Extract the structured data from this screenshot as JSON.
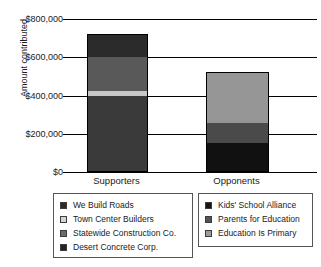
{
  "chart_data": {
    "type": "bar",
    "subtype": "stacked-bar",
    "title": "",
    "xlabel": "",
    "ylabel": "Amount contributed",
    "categories": [
      "Supporters",
      "Opponents"
    ],
    "ylim": [
      0,
      800000
    ],
    "ytick_values": [
      0,
      200000,
      400000,
      600000,
      800000
    ],
    "ytick_labels": [
      "$0",
      "$200,000",
      "$400,000",
      "$600,000",
      "$800,000"
    ],
    "grid": true,
    "legend_position": "bottom",
    "series": [
      {
        "name": "We Build Roads",
        "group": "Supporters",
        "color": "#2b2b2b",
        "values": [
          115000,
          0
        ]
      },
      {
        "name": "Town Center Builders",
        "group": "Supporters",
        "color": "#c8c8c8",
        "values": [
          30000,
          0
        ]
      },
      {
        "name": "Statewide Construction Co.",
        "group": "Supporters",
        "color": "#595959",
        "values": [
          175000,
          0
        ]
      },
      {
        "name": "Desert Concrete Corp.",
        "group": "Supporters",
        "color": "#3a3a3a",
        "values": [
          390000,
          0
        ]
      },
      {
        "name": "Kids' School Alliance",
        "group": "Opponents",
        "color": "#111111",
        "values": [
          0,
          145000
        ]
      },
      {
        "name": "Parents for Education",
        "group": "Opponents",
        "color": "#4a4a4a",
        "values": [
          0,
          105000
        ]
      },
      {
        "name": "Education Is Primary",
        "group": "Opponents",
        "color": "#969696",
        "values": [
          0,
          260000
        ]
      }
    ],
    "totals": [
      710000,
      510000
    ],
    "bars": [
      {
        "category": "Supporters",
        "total": 710000,
        "segments": [
          {
            "name": "Desert Concrete Corp.",
            "value": 390000,
            "color": "#3a3a3a"
          },
          {
            "name": "Town Center Builders",
            "value": 30000,
            "color": "#c8c8c8"
          },
          {
            "name": "Statewide Construction Co.",
            "value": 175000,
            "color": "#595959"
          },
          {
            "name": "We Build Roads",
            "value": 115000,
            "color": "#2b2b2b"
          }
        ]
      },
      {
        "category": "Opponents",
        "total": 510000,
        "segments": [
          {
            "name": "Kids' School Alliance",
            "value": 145000,
            "color": "#111111"
          },
          {
            "name": "Parents for Education",
            "value": 105000,
            "color": "#4a4a4a"
          },
          {
            "name": "Education Is Primary",
            "value": 260000,
            "color": "#969696"
          }
        ]
      }
    ]
  },
  "legends": {
    "left": {
      "items": [
        {
          "label": "We Build Roads",
          "color": "#2b2b2b"
        },
        {
          "label": "Town Center Builders",
          "color": "#d4d4d4"
        },
        {
          "label": "Statewide Construction Co.",
          "color": "#6b6b6b"
        },
        {
          "label": "Desert Concrete Corp.",
          "color": "#232323"
        }
      ]
    },
    "right": {
      "items": [
        {
          "label": "Kids' School Alliance",
          "color": "#141414"
        },
        {
          "label": "Parents for Education",
          "color": "#545454"
        },
        {
          "label": "Education Is Primary",
          "color": "#9b9b9b"
        }
      ]
    }
  }
}
